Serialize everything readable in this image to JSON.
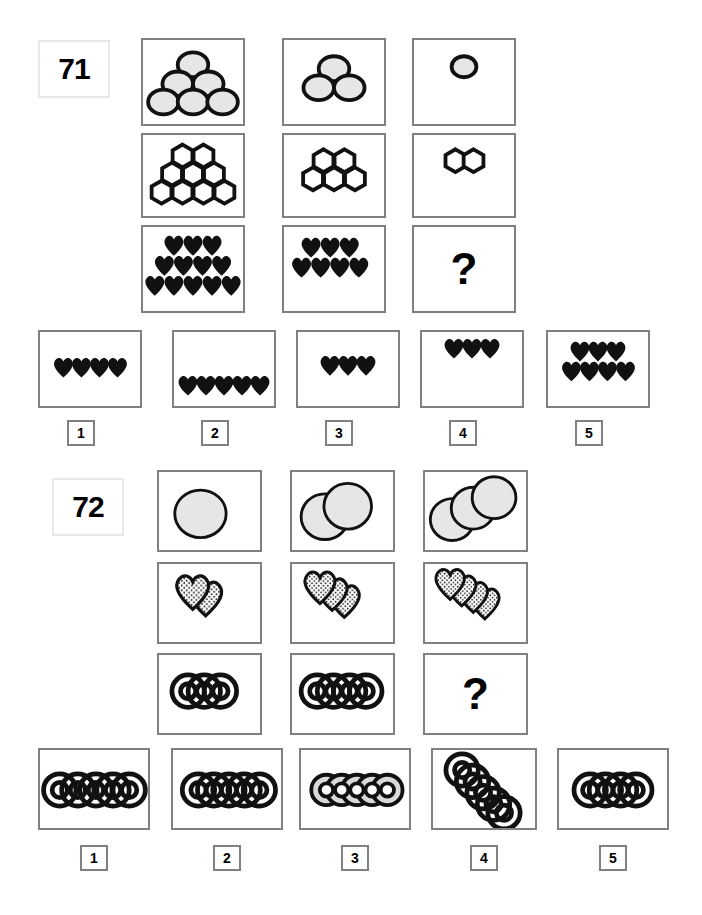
{
  "page": {
    "background": "#ffffff",
    "box_border_color": "#808080",
    "ink_color": "#000000",
    "circle_fill": "#e6e6e6"
  },
  "puzzles": [
    {
      "id": "puzzle-71",
      "number_label": "71",
      "question_mark": "?",
      "matrix": {
        "rows": [
          {
            "row_name": "circles-row",
            "shape": "circle",
            "fill": "#e6e6e6",
            "cells": [
              {
                "name": "cell-r1c1",
                "count": 6,
                "layout": "pyramid",
                "rows": [
                  1,
                  2,
                  3
                ]
              },
              {
                "name": "cell-r1c2",
                "count": 3,
                "layout": "pyramid",
                "rows": [
                  1,
                  2
                ]
              },
              {
                "name": "cell-r1c3",
                "count": 1,
                "layout": "pyramid",
                "rows": [
                  1
                ]
              }
            ]
          },
          {
            "row_name": "hexagons-row",
            "shape": "hexagon",
            "fill": "#ffffff",
            "cells": [
              {
                "name": "cell-r2c1",
                "count": 9,
                "layout": "pyramid",
                "rows": [
                  2,
                  3,
                  4
                ]
              },
              {
                "name": "cell-r2c2",
                "count": 5,
                "layout": "pyramid",
                "rows": [
                  2,
                  3
                ]
              },
              {
                "name": "cell-r2c3",
                "count": 2,
                "layout": "pyramid",
                "rows": [
                  2
                ]
              }
            ]
          },
          {
            "row_name": "hearts-row",
            "shape": "heart",
            "fill": "#000000",
            "cells": [
              {
                "name": "cell-r3c1",
                "count": 12,
                "layout": "pyramid",
                "rows": [
                  3,
                  4,
                  5
                ]
              },
              {
                "name": "cell-r3c2",
                "count": 7,
                "layout": "pyramid",
                "rows": [
                  3,
                  4
                ]
              },
              {
                "name": "cell-r3c3",
                "count": 0,
                "layout": "question",
                "rows": []
              }
            ]
          }
        ]
      },
      "options": [
        {
          "name": "option-1",
          "label": "1",
          "shape": "heart",
          "count": 4,
          "rows": [
            4
          ],
          "align": "middle"
        },
        {
          "name": "option-2",
          "label": "2",
          "shape": "heart",
          "count": 5,
          "rows": [
            5
          ],
          "align": "bottom"
        },
        {
          "name": "option-3",
          "label": "3",
          "shape": "heart",
          "count": 3,
          "rows": [
            3
          ],
          "align": "middle"
        },
        {
          "name": "option-4",
          "label": "4",
          "shape": "heart",
          "count": 3,
          "rows": [
            3
          ],
          "align": "top"
        },
        {
          "name": "option-5",
          "label": "5",
          "shape": "heart",
          "count": 7,
          "rows": [
            3,
            4
          ],
          "align": "top"
        }
      ]
    },
    {
      "id": "puzzle-72",
      "number_label": "72",
      "question_mark": "?",
      "matrix": {
        "rows": [
          {
            "row_name": "discs-row",
            "shape": "disc",
            "fill": "#e6e6e6",
            "cells": [
              {
                "name": "cell-r1c1",
                "count": 1,
                "layout": "diagonal-stack"
              },
              {
                "name": "cell-r1c2",
                "count": 2,
                "layout": "diagonal-stack"
              },
              {
                "name": "cell-r1c3",
                "count": 3,
                "layout": "diagonal-stack"
              }
            ]
          },
          {
            "row_name": "dotted-hearts-row",
            "shape": "dotted-heart",
            "fill": "dotted",
            "cells": [
              {
                "name": "cell-r2c1",
                "count": 2,
                "layout": "diagonal-stack"
              },
              {
                "name": "cell-r2c2",
                "count": 3,
                "layout": "diagonal-stack"
              },
              {
                "name": "cell-r2c3",
                "count": 4,
                "layout": "diagonal-stack"
              }
            ]
          },
          {
            "row_name": "rings-row",
            "shape": "ring",
            "fill": "#ffffff",
            "cells": [
              {
                "name": "cell-r3c1",
                "count": 3,
                "layout": "horizontal-overlap"
              },
              {
                "name": "cell-r3c2",
                "count": 4,
                "layout": "horizontal-overlap"
              },
              {
                "name": "cell-r3c3",
                "count": 0,
                "layout": "question"
              }
            ]
          }
        ]
      },
      "options": [
        {
          "name": "option-1",
          "label": "1",
          "shape": "ring",
          "count": 5,
          "layout": "horizontal-spaced",
          "fill": "#ffffff"
        },
        {
          "name": "option-2",
          "label": "2",
          "shape": "ring",
          "count": 5,
          "layout": "horizontal-overlap",
          "fill": "#ffffff"
        },
        {
          "name": "option-3",
          "label": "3",
          "shape": "ring",
          "count": 5,
          "layout": "horizontal-overlap",
          "fill": "#d9d9d9"
        },
        {
          "name": "option-4",
          "label": "4",
          "shape": "ring",
          "count": 5,
          "layout": "diagonal-overlap",
          "fill": "#ffffff"
        },
        {
          "name": "option-5",
          "label": "5",
          "shape": "ring",
          "count": 4,
          "layout": "horizontal-overlap",
          "fill": "#ffffff"
        }
      ]
    }
  ]
}
